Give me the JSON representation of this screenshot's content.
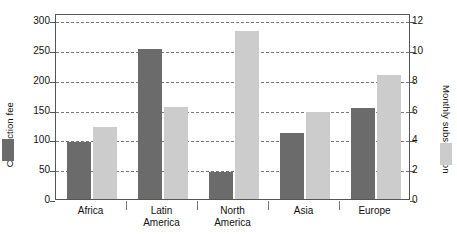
{
  "chart_data": {
    "type": "bar",
    "title": "",
    "subtitle": "",
    "xlabel": "",
    "categories": [
      "Africa",
      "Latin America",
      "North America",
      "Asia",
      "Europe"
    ],
    "category_lines": [
      [
        "Africa"
      ],
      [
        "Latin",
        "America"
      ],
      [
        "North",
        "America"
      ],
      [
        "Asia"
      ],
      [
        "Europe"
      ]
    ],
    "grid": true,
    "legend_position": "outside-left-and-right-axis-swatches",
    "series": [
      {
        "name": "Connection fee",
        "axis": "left",
        "color": "#6B6B6B",
        "values": [
          95,
          252,
          45,
          110,
          153
        ]
      },
      {
        "name": "Monthly subscription",
        "axis": "right",
        "color": "#CCCCCC",
        "values": [
          4.8,
          6.2,
          11.3,
          5.85,
          8.3
        ]
      }
    ],
    "axes": {
      "left": {
        "label": "Connection fee",
        "ticks": [
          0,
          50,
          100,
          150,
          200,
          250,
          300
        ],
        "tick_labels": [
          "0",
          "50",
          "100",
          "150",
          "200",
          "250",
          "300"
        ],
        "lim": [
          0,
          312
        ]
      },
      "right": {
        "label": "Monthly subscription",
        "ticks": [
          0,
          2,
          4,
          6,
          8,
          10,
          12
        ],
        "tick_labels": [
          "0",
          "2",
          "4",
          "6",
          "8",
          "10",
          "12"
        ],
        "lim": [
          0,
          12.48
        ]
      }
    }
  },
  "colors": {
    "fee_bar": "#6B6B6B",
    "subscription_bar": "#CCCCCC",
    "frame": "#555555",
    "grid": "#777777",
    "text": "#111111",
    "background": "#FFFFFF"
  }
}
